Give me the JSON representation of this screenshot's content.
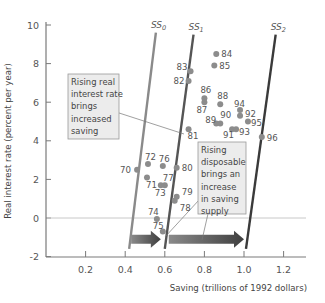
{
  "chart_data": {
    "type": "scatter",
    "title": "",
    "xlabel": "Saving (trillions of 1992 dollars)",
    "ylabel": "Real interest rate (percent per year)",
    "xlim": [
      0,
      1.3
    ],
    "ylim": [
      -2,
      10.5
    ],
    "x_ticks": [
      "0.2",
      "0.4",
      "0.6",
      "0.8",
      "1.0",
      "1.2"
    ],
    "x_tick_values": [
      0.2,
      0.4,
      0.6,
      0.8,
      1.0,
      1.2
    ],
    "y_ticks": [
      "-2",
      "0",
      "2",
      "4",
      "6",
      "8",
      "10"
    ],
    "y_tick_values": [
      -2,
      0,
      2,
      4,
      6,
      8,
      10
    ],
    "grid": false,
    "zero_line": true,
    "points": [
      {
        "label": "70",
        "x": 0.46,
        "y": 2.5
      },
      {
        "label": "71",
        "x": 0.51,
        "y": 2.1
      },
      {
        "label": "72",
        "x": 0.515,
        "y": 2.8
      },
      {
        "label": "73",
        "x": 0.58,
        "y": 1.7
      },
      {
        "label": "74",
        "x": 0.56,
        "y": -0.05
      },
      {
        "label": "75",
        "x": 0.59,
        "y": -0.7
      },
      {
        "label": "76",
        "x": 0.59,
        "y": 2.7
      },
      {
        "label": "77",
        "x": 0.6,
        "y": 1.7
      },
      {
        "label": "78",
        "x": 0.65,
        "y": 0.9
      },
      {
        "label": "79",
        "x": 0.66,
        "y": 1.1
      },
      {
        "label": "80",
        "x": 0.66,
        "y": 2.6
      },
      {
        "label": "81",
        "x": 0.72,
        "y": 4.6
      },
      {
        "label": "82",
        "x": 0.72,
        "y": 7.1
      },
      {
        "label": "83",
        "x": 0.73,
        "y": 7.6
      },
      {
        "label": "84",
        "x": 0.86,
        "y": 8.5
      },
      {
        "label": "85",
        "x": 0.85,
        "y": 7.9
      },
      {
        "label": "86",
        "x": 0.8,
        "y": 6.2
      },
      {
        "label": "87",
        "x": 0.8,
        "y": 6.0
      },
      {
        "label": "88",
        "x": 0.88,
        "y": 5.9
      },
      {
        "label": "89",
        "x": 0.86,
        "y": 4.9
      },
      {
        "label": "90",
        "x": 0.88,
        "y": 4.9
      },
      {
        "label": "91",
        "x": 0.94,
        "y": 4.6
      },
      {
        "label": "92",
        "x": 0.98,
        "y": 5.3
      },
      {
        "label": "93",
        "x": 0.96,
        "y": 4.6
      },
      {
        "label": "94",
        "x": 0.98,
        "y": 5.6
      },
      {
        "label": "95",
        "x": 1.02,
        "y": 5.0
      },
      {
        "label": "96",
        "x": 1.09,
        "y": 4.2
      }
    ],
    "supply_curves": [
      {
        "name": "SS0",
        "label_main": "SS",
        "label_sub": "0",
        "from": [
          0.42,
          -1.6
        ],
        "to": [
          0.555,
          9.6
        ],
        "color": "#8a8a8a"
      },
      {
        "name": "SS1",
        "label_main": "SS",
        "label_sub": "1",
        "from": [
          0.6,
          -1.6
        ],
        "to": [
          0.745,
          9.5
        ],
        "color": "#555555"
      },
      {
        "name": "SS2",
        "label_main": "SS",
        "label_sub": "2",
        "from": [
          1.01,
          -1.6
        ],
        "to": [
          1.16,
          9.5
        ],
        "color": "#3a3a3a"
      }
    ],
    "arrows": [
      {
        "from": [
          0.43,
          -1.1
        ],
        "to": [
          0.58,
          -1.1
        ]
      },
      {
        "from": [
          0.62,
          -1.1
        ],
        "to": [
          1.0,
          -1.1
        ]
      }
    ],
    "annotations": [
      {
        "id": "real-rate-note",
        "lines": [
          "Rising real",
          "interest rate",
          "brings",
          "increased",
          "saving"
        ]
      },
      {
        "id": "disposable-note",
        "lines": [
          "Rising",
          "disposable",
          "brings an",
          "increase",
          "in saving",
          "supply"
        ]
      }
    ]
  },
  "colors": {
    "axis": "#7a7a7a",
    "point": "#8c8c8c",
    "zero_line": "#c8c8c8",
    "note_bg": "#ececec",
    "note_border": "#9a9a9a",
    "arrow": "#555555"
  }
}
